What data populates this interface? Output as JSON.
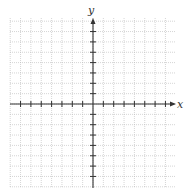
{
  "diagram": {
    "type": "coordinate-plane",
    "x_axis_label": "x",
    "y_axis_label": "y",
    "x_range": [
      -8,
      8
    ],
    "y_range": [
      -8,
      8
    ],
    "ticks_per_side": 7,
    "grid": true,
    "colors": {
      "background": "#ffffff",
      "grid": "#b8b8b8",
      "axis": "#333333"
    }
  }
}
